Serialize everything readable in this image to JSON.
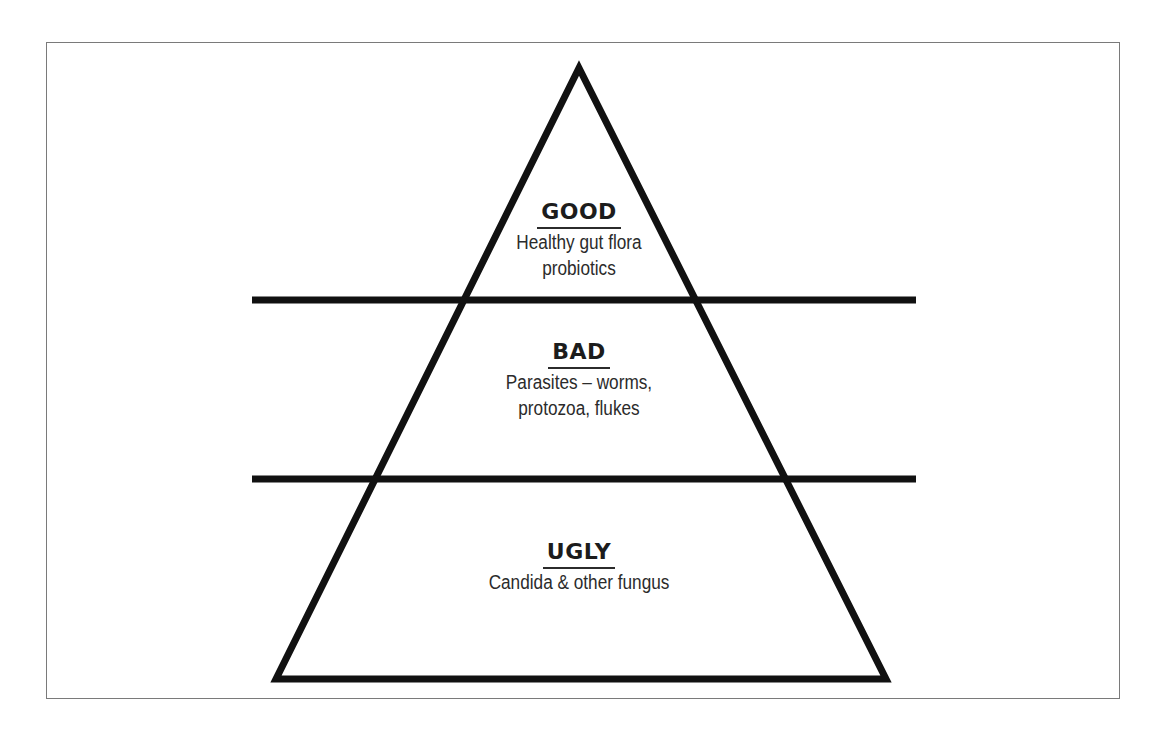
{
  "diagram": {
    "type": "pyramid",
    "colors": {
      "stroke": "#111111",
      "frame": "#7a7a7a",
      "text": "#2b2b2b",
      "background": "#ffffff"
    },
    "tiers": [
      {
        "title": "GOOD",
        "lines": [
          "Healthy gut flora",
          "probiotics"
        ]
      },
      {
        "title": "BAD",
        "lines": [
          "Parasites – worms,",
          "protozoa, flukes"
        ]
      },
      {
        "title": "UGLY",
        "lines": [
          "Candida & other fungus"
        ]
      }
    ]
  }
}
